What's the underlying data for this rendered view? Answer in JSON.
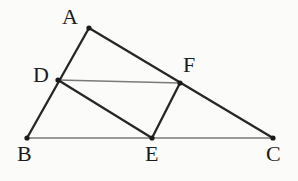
{
  "figure": {
    "kind": "geometry-diagram",
    "width": 298,
    "height": 181,
    "background_color": "#fbfbf9"
  },
  "style": {
    "thick_stroke_color": "#262626",
    "thick_stroke_width": 2.3,
    "thin_stroke_color": "#7a7a7a",
    "thin_stroke_width": 1.5,
    "vertex_dot_color": "#1a1a1a",
    "vertex_dot_radius": 2.6,
    "label_color": "#1c1c1c",
    "label_font_size": 22
  },
  "points": [
    {
      "id": "A",
      "label": "A",
      "x": 89,
      "y": 28,
      "label_x": 62,
      "label_y": 6
    },
    {
      "id": "B",
      "label": "B",
      "x": 27,
      "y": 138,
      "label_x": 17,
      "label_y": 143
    },
    {
      "id": "C",
      "label": "C",
      "x": 273,
      "y": 138,
      "label_x": 266,
      "label_y": 143
    },
    {
      "id": "D",
      "label": "D",
      "x": 58,
      "y": 80,
      "label_x": 33,
      "label_y": 64
    },
    {
      "id": "E",
      "label": "E",
      "x": 152,
      "y": 138,
      "label_x": 145,
      "label_y": 143
    },
    {
      "id": "F",
      "label": "F",
      "x": 180,
      "y": 83,
      "label_x": 183,
      "label_y": 54
    }
  ],
  "segments": [
    {
      "id": "AB",
      "from": "A",
      "to": "B",
      "weight": "thick",
      "x1": 89,
      "y1": 28,
      "x2": 27,
      "y2": 138
    },
    {
      "id": "AC",
      "from": "A",
      "to": "C",
      "weight": "thick",
      "x1": 89,
      "y1": 28,
      "x2": 273,
      "y2": 138
    },
    {
      "id": "BC",
      "from": "B",
      "to": "C",
      "weight": "thin",
      "x1": 27,
      "y1": 138,
      "x2": 273,
      "y2": 138
    },
    {
      "id": "DF",
      "from": "D",
      "to": "F",
      "weight": "thin",
      "x1": 58,
      "y1": 80,
      "x2": 180,
      "y2": 83
    },
    {
      "id": "DE",
      "from": "D",
      "to": "E",
      "weight": "thick",
      "x1": 58,
      "y1": 80,
      "x2": 152,
      "y2": 138
    },
    {
      "id": "EF",
      "from": "E",
      "to": "F",
      "weight": "thick",
      "x1": 152,
      "y1": 138,
      "x2": 180,
      "y2": 83
    }
  ]
}
